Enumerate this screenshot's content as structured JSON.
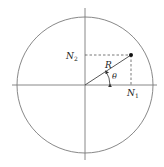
{
  "diagram": {
    "title": "",
    "colors": {
      "stroke": "#6f6f6f",
      "axis": "#7a7a7a",
      "dashed": "#555555",
      "point": "#111111",
      "text": "#222222"
    },
    "circle": {
      "cx": 85,
      "cy": 85,
      "r": 68
    },
    "axes": {
      "horizontal": {
        "x1": 12,
        "x2": 157,
        "y": 85
      },
      "vertical": {
        "x": 85,
        "y1": 8,
        "y2": 160
      }
    },
    "point": {
      "x": 131,
      "y": 55
    },
    "labels": {
      "radius": "R",
      "angle": "θ",
      "projection_x": "N",
      "projection_x_sub": "1",
      "projection_y": "N",
      "projection_y_sub": "2"
    }
  }
}
